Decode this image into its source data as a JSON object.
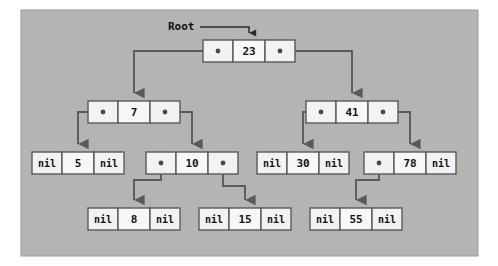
{
  "diagram": {
    "root_label": "Root",
    "nil_label": "nil",
    "colors": {
      "panel_background": "#b4b4b4",
      "panel_border": "#9a9a9a",
      "page_background": "#ffffff",
      "node_fill": "#f2f2f2",
      "node_border": "#5a5a5a",
      "pointer_dot": "#4a4a4a",
      "link_stroke": "#5a5a5a",
      "text": "#121212"
    },
    "panel": {
      "x": 21,
      "y": 10,
      "width": 457,
      "height": 246
    },
    "node_geometry": {
      "cell_width": 30,
      "value_cell_width": 32,
      "node_height": 22,
      "row_y": [
        40,
        101,
        152,
        208
      ]
    },
    "nodes": [
      {
        "id": "n23",
        "value": "23",
        "level": 0,
        "x": 203,
        "y": 40,
        "left": "dot",
        "right": "dot",
        "left_child": "n7",
        "right_child": "n41"
      },
      {
        "id": "n7",
        "value": "7",
        "level": 1,
        "x": 88,
        "y": 101,
        "left": "dot",
        "right": "dot",
        "left_child": "n5",
        "right_child": "n10"
      },
      {
        "id": "n41",
        "value": "41",
        "level": 1,
        "x": 306,
        "y": 101,
        "left": "dot",
        "right": "dot",
        "left_child": "n30",
        "right_child": "n78"
      },
      {
        "id": "n5",
        "value": "5",
        "level": 2,
        "x": 32,
        "y": 152,
        "left": "nil",
        "right": "nil",
        "left_child": null,
        "right_child": null
      },
      {
        "id": "n10",
        "value": "10",
        "level": 2,
        "x": 146,
        "y": 152,
        "left": "dot",
        "right": "dot",
        "left_child": "n8",
        "right_child": "n15"
      },
      {
        "id": "n30",
        "value": "30",
        "level": 2,
        "x": 257,
        "y": 152,
        "left": "nil",
        "right": "nil",
        "left_child": null,
        "right_child": null
      },
      {
        "id": "n78",
        "value": "78",
        "level": 2,
        "x": 364,
        "y": 152,
        "left": "dot",
        "right": "nil",
        "left_child": "n55",
        "right_child": null
      },
      {
        "id": "n8",
        "value": "8",
        "level": 3,
        "x": 88,
        "y": 208,
        "left": "nil",
        "right": "nil",
        "left_child": null,
        "right_child": null
      },
      {
        "id": "n15",
        "value": "15",
        "level": 3,
        "x": 199,
        "y": 208,
        "left": "nil",
        "right": "nil",
        "left_child": null,
        "right_child": null
      },
      {
        "id": "n55",
        "value": "55",
        "level": 3,
        "x": 310,
        "y": 208,
        "left": "nil",
        "right": "nil",
        "left_child": null,
        "right_child": null
      }
    ],
    "values_in_order": [
      "5",
      "7",
      "8",
      "10",
      "15",
      "23",
      "30",
      "41",
      "55",
      "78"
    ],
    "root_pointer": {
      "label": "Root",
      "label_x": 168,
      "label_y": 27,
      "line_from_x": 200,
      "line_to_x": 248,
      "line_y": 27,
      "arrow_tip_y": 40
    }
  }
}
